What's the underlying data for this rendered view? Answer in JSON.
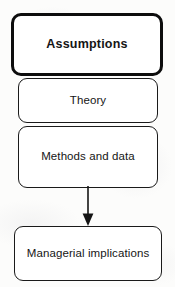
{
  "diagram": {
    "type": "flowchart",
    "orientation": "vertical",
    "background_color": "#fcfcfb",
    "stroke_color": "#151515",
    "fill_color": "#ffffff",
    "nodes": [
      {
        "id": "assumptions",
        "label": "Assumptions",
        "emphasis": "bold",
        "border_weight": "thick",
        "shape": "rounded-rectangle"
      },
      {
        "id": "theory",
        "label": "Theory",
        "emphasis": "normal",
        "border_weight": "thin",
        "shape": "rounded-rectangle"
      },
      {
        "id": "methods",
        "label": "Methods and data",
        "emphasis": "normal",
        "border_weight": "thin",
        "shape": "rounded-rectangle"
      },
      {
        "id": "implications",
        "label": "Managerial implications",
        "emphasis": "normal",
        "border_weight": "thin",
        "shape": "rounded-rectangle"
      }
    ],
    "connectors": [
      {
        "id": "methods-to-implications",
        "from": "methods",
        "to": "implications",
        "style": "solid",
        "arrowhead": "filled-triangle",
        "direction": "down"
      }
    ]
  }
}
